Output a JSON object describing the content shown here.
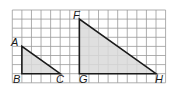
{
  "diagram": {
    "type": "similar-right-triangles-on-grid",
    "grid": {
      "columns": 16,
      "rows": 8,
      "origin_px": [
        12.3,
        10
      ],
      "cell_w": 9.58,
      "cell_h": 9.1,
      "line_color": "#9a9a9a"
    },
    "fill_color": "#d9d9d9",
    "stroke_color": "#1a1a1a",
    "triangles": [
      {
        "name": "ABC",
        "vertices": [
          {
            "label": "A",
            "col": 1,
            "row": 4
          },
          {
            "label": "B",
            "col": 1,
            "row": 7
          },
          {
            "label": "C",
            "col": 5,
            "row": 7
          }
        ]
      },
      {
        "name": "FGH",
        "vertices": [
          {
            "label": "F",
            "col": 7,
            "row": 1
          },
          {
            "label": "G",
            "col": 7,
            "row": 7
          },
          {
            "label": "H",
            "col": 15,
            "row": 7
          }
        ]
      }
    ],
    "labels": {
      "A": "A",
      "B": "B",
      "C": "C",
      "F": "F",
      "G": "G",
      "H": "H"
    }
  }
}
